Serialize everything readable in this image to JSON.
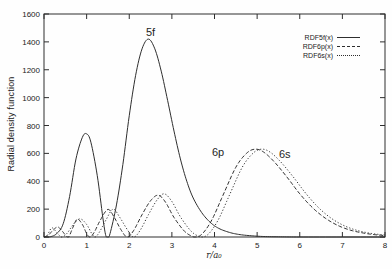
{
  "figure": {
    "background": "#fefefe",
    "ink_color": "#2e2e2e",
    "text_color": "#222222"
  },
  "chart_data": {
    "type": "line",
    "title": "",
    "xlabel": "r/a₀",
    "ylabel": "Radial density function",
    "xlim": [
      0,
      8
    ],
    "ylim": [
      0,
      1600
    ],
    "xticks": [
      0,
      1,
      2,
      3,
      4,
      5,
      6,
      7,
      8
    ],
    "yticks": [
      0,
      200,
      400,
      600,
      800,
      1000,
      1200,
      1400,
      1600
    ],
    "grid": false,
    "legend_position": "top-right",
    "series": [
      {
        "name": "RDF5f(x)",
        "annotation": "5f",
        "line_style": "solid",
        "peaks": [
          [
            1.0,
            740
          ],
          [
            2.45,
            1420
          ]
        ],
        "points": [
          [
            0,
            0
          ],
          [
            0.15,
            2
          ],
          [
            0.3,
            25
          ],
          [
            0.45,
            95
          ],
          [
            0.6,
            290
          ],
          [
            0.75,
            560
          ],
          [
            0.9,
            715
          ],
          [
            1.0,
            740
          ],
          [
            1.1,
            680
          ],
          [
            1.25,
            440
          ],
          [
            1.38,
            140
          ],
          [
            1.45,
            10
          ],
          [
            1.5,
            0
          ],
          [
            1.55,
            25
          ],
          [
            1.7,
            230
          ],
          [
            1.85,
            520
          ],
          [
            2.0,
            870
          ],
          [
            2.15,
            1160
          ],
          [
            2.3,
            1350
          ],
          [
            2.45,
            1420
          ],
          [
            2.6,
            1350
          ],
          [
            2.75,
            1190
          ],
          [
            2.9,
            980
          ],
          [
            3.05,
            760
          ],
          [
            3.2,
            560
          ],
          [
            3.35,
            400
          ],
          [
            3.5,
            280
          ],
          [
            3.7,
            175
          ],
          [
            3.9,
            105
          ],
          [
            4.1,
            62
          ],
          [
            4.35,
            33
          ],
          [
            4.6,
            17
          ],
          [
            4.9,
            8
          ],
          [
            5.2,
            3
          ],
          [
            5.6,
            1
          ],
          [
            6.0,
            0
          ],
          [
            7.0,
            0
          ],
          [
            8.0,
            0
          ]
        ]
      },
      {
        "name": "RDF6p(x)",
        "annotation": "6p",
        "line_style": "dashed",
        "peaks": [
          [
            0.32,
            72
          ],
          [
            0.78,
            128
          ],
          [
            1.5,
            198
          ],
          [
            2.68,
            300
          ],
          [
            4.95,
            630
          ]
        ],
        "points": [
          [
            0,
            0
          ],
          [
            0.1,
            12
          ],
          [
            0.2,
            45
          ],
          [
            0.32,
            72
          ],
          [
            0.42,
            45
          ],
          [
            0.52,
            8
          ],
          [
            0.58,
            0
          ],
          [
            0.68,
            70
          ],
          [
            0.78,
            128
          ],
          [
            0.9,
            90
          ],
          [
            1.0,
            25
          ],
          [
            1.08,
            0
          ],
          [
            1.18,
            35
          ],
          [
            1.32,
            120
          ],
          [
            1.5,
            198
          ],
          [
            1.65,
            140
          ],
          [
            1.8,
            55
          ],
          [
            1.95,
            0
          ],
          [
            2.1,
            45
          ],
          [
            2.3,
            160
          ],
          [
            2.5,
            260
          ],
          [
            2.68,
            300
          ],
          [
            2.85,
            250
          ],
          [
            3.05,
            140
          ],
          [
            3.3,
            40
          ],
          [
            3.5,
            2
          ],
          [
            3.6,
            0
          ],
          [
            3.75,
            35
          ],
          [
            3.95,
            130
          ],
          [
            4.2,
            300
          ],
          [
            4.5,
            500
          ],
          [
            4.75,
            600
          ],
          [
            4.95,
            630
          ],
          [
            5.15,
            610
          ],
          [
            5.4,
            540
          ],
          [
            5.7,
            430
          ],
          [
            6.0,
            310
          ],
          [
            6.3,
            210
          ],
          [
            6.6,
            135
          ],
          [
            6.9,
            82
          ],
          [
            7.2,
            48
          ],
          [
            7.5,
            28
          ],
          [
            7.75,
            17
          ],
          [
            8.0,
            10
          ]
        ]
      },
      {
        "name": "RDF6s(x)",
        "annotation": "6s",
        "line_style": "dotted",
        "peaks": [
          [
            0.18,
            65
          ],
          [
            0.85,
            130
          ],
          [
            1.62,
            200
          ],
          [
            2.82,
            310
          ],
          [
            5.1,
            630
          ]
        ],
        "points": [
          [
            0,
            0
          ],
          [
            0.08,
            15
          ],
          [
            0.18,
            65
          ],
          [
            0.28,
            40
          ],
          [
            0.38,
            5
          ],
          [
            0.44,
            0
          ],
          [
            0.55,
            30
          ],
          [
            0.7,
            95
          ],
          [
            0.85,
            130
          ],
          [
            1.0,
            90
          ],
          [
            1.12,
            25
          ],
          [
            1.2,
            0
          ],
          [
            1.3,
            35
          ],
          [
            1.45,
            120
          ],
          [
            1.62,
            200
          ],
          [
            1.78,
            140
          ],
          [
            1.95,
            55
          ],
          [
            2.1,
            0
          ],
          [
            2.25,
            45
          ],
          [
            2.45,
            160
          ],
          [
            2.65,
            265
          ],
          [
            2.82,
            310
          ],
          [
            3.0,
            255
          ],
          [
            3.2,
            145
          ],
          [
            3.45,
            42
          ],
          [
            3.65,
            2
          ],
          [
            3.75,
            0
          ],
          [
            3.9,
            35
          ],
          [
            4.1,
            130
          ],
          [
            4.35,
            300
          ],
          [
            4.65,
            500
          ],
          [
            4.9,
            600
          ],
          [
            5.1,
            630
          ],
          [
            5.3,
            610
          ],
          [
            5.55,
            540
          ],
          [
            5.85,
            430
          ],
          [
            6.15,
            310
          ],
          [
            6.45,
            208
          ],
          [
            6.75,
            132
          ],
          [
            7.05,
            80
          ],
          [
            7.35,
            47
          ],
          [
            7.65,
            27
          ],
          [
            7.9,
            17
          ],
          [
            8.0,
            14
          ]
        ]
      }
    ],
    "annotations": [
      {
        "text": "5f"
      },
      {
        "text": "6p"
      },
      {
        "text": "6s"
      }
    ]
  },
  "legend": {
    "entries": [
      {
        "label": "RDF5f(x)",
        "style": "solid"
      },
      {
        "label": "RDF6p(x)",
        "style": "dashed"
      },
      {
        "label": "RDF6s(x)",
        "style": "dotted"
      }
    ]
  }
}
